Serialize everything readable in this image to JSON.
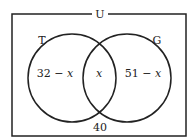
{
  "diagram": {
    "type": "venn",
    "universe_label": "U",
    "sets": [
      {
        "name": "T",
        "label": "T"
      },
      {
        "name": "G",
        "label": "G"
      }
    ],
    "regions": {
      "t_only": {
        "num": "32 − ",
        "var": "x"
      },
      "intersection": {
        "var": "x"
      },
      "g_only": {
        "num": "51 − ",
        "var": "x"
      },
      "outside": "40"
    },
    "colors": {
      "stroke": "#222222",
      "background": "#ffffff"
    }
  }
}
